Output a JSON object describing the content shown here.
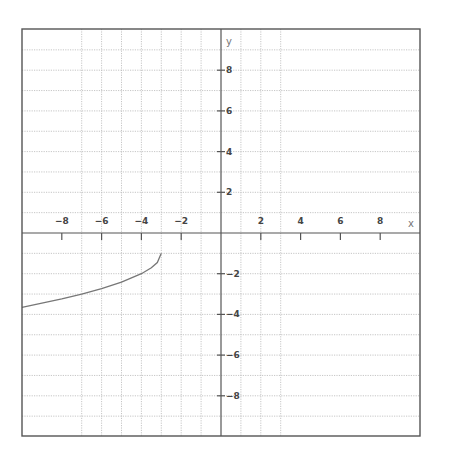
{
  "chart_data": {
    "type": "line",
    "title": "",
    "xlabel": "x",
    "ylabel": "y",
    "xlim": [
      -10,
      10
    ],
    "ylim": [
      -10,
      10
    ],
    "grid": true,
    "grid_style": "dotted",
    "horizontal_grid_y": [
      -9,
      -8,
      -7,
      -6,
      -5,
      -4,
      -3,
      -2,
      -1,
      1,
      2,
      3,
      4,
      5,
      6,
      7,
      8,
      9
    ],
    "vertical_grid_x": [
      -7,
      -6,
      -5,
      -4,
      -3,
      -2,
      -1,
      1,
      2,
      3
    ],
    "x_ticks": [
      {
        "value": -8,
        "label": "−8"
      },
      {
        "value": -6,
        "label": "−6"
      },
      {
        "value": -4,
        "label": "−4"
      },
      {
        "value": -2,
        "label": "−2"
      },
      {
        "value": 2,
        "label": "2"
      },
      {
        "value": 4,
        "label": "4"
      },
      {
        "value": 6,
        "label": "6"
      },
      {
        "value": 8,
        "label": "8"
      }
    ],
    "y_ticks": [
      {
        "value": 8,
        "label": "8"
      },
      {
        "value": 6,
        "label": "6"
      },
      {
        "value": 4,
        "label": "4"
      },
      {
        "value": 2,
        "label": "2"
      },
      {
        "value": -2,
        "label": "−2"
      },
      {
        "value": -4,
        "label": "−4"
      },
      {
        "value": -6,
        "label": "−6"
      },
      {
        "value": -8,
        "label": "−8"
      }
    ],
    "series": [
      {
        "name": "y = -1 - sqrt(-x - 3)",
        "color": "#777777",
        "x": [
          -10,
          -9,
          -8,
          -7,
          -6,
          -5,
          -4,
          -3.5,
          -3.2,
          -3
        ],
        "y": [
          -3.65,
          -3.45,
          -3.24,
          -3.0,
          -2.73,
          -2.41,
          -2.0,
          -1.71,
          -1.45,
          -1.0
        ]
      }
    ]
  }
}
